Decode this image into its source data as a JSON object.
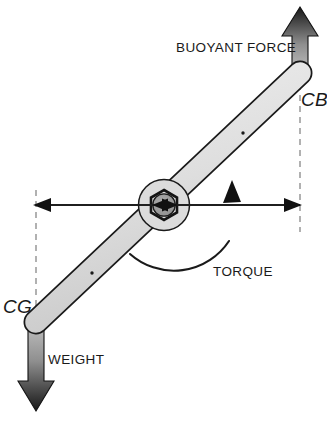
{
  "figure": {
    "type": "physics-free-body-diagram",
    "width": 327,
    "height": 421,
    "background_color": "#ffffff"
  },
  "labels": {
    "buoyant_force": "BUOYANT FORCE",
    "weight": "WEIGHT",
    "torque": "TORQUE",
    "cb": "CB",
    "cg": "CG"
  },
  "colors": {
    "outline": "#1a1a1a",
    "beam_fill_light": "#e6e6e6",
    "beam_fill_mid": "#d2d2d2",
    "hub_fill": "#d9d9d9",
    "nut_fill": "#9a9a9a",
    "arrow_dark": "#1c1c1c",
    "arrow_light": "#b9b9b9",
    "dash_line": "#9e9e9e",
    "text": "#1a1a1a"
  },
  "elements": {
    "beam": {
      "name": "tilted-beam",
      "cg_end": [
        36,
        322
      ],
      "cb_end": [
        300,
        73
      ],
      "half_width": 11,
      "marker_dots": [
        [
          92,
          273
        ],
        [
          243,
          133
        ]
      ]
    },
    "pivot": {
      "name": "pivot-hub",
      "center": [
        164,
        205
      ],
      "outer_radius": 25,
      "nut_radius": 15,
      "inner_radius": 11
    },
    "buoyant_force_arrow": {
      "direction": "up",
      "x": 300,
      "tail_y": 73,
      "head_y": 8,
      "shaft_width": 16,
      "head_width": 36,
      "head_length": 28,
      "gradient": "light-at-tail-dark-at-head"
    },
    "weight_arrow": {
      "direction": "down",
      "x": 36,
      "tail_y": 322,
      "head_y": 410,
      "shaft_width": 16,
      "head_width": 36,
      "head_length": 28,
      "gradient": "light-at-tail-dark-at-head"
    },
    "horizontal_axis": {
      "name": "separation-double-arrow",
      "y": 205,
      "x_left": 33,
      "x_right": 300
    },
    "dashed_verticals": [
      {
        "name": "cg-vertical",
        "x": 36,
        "y_top": 190,
        "y_bottom": 336
      },
      {
        "name": "cb-vertical",
        "x": 300,
        "y_top": 62,
        "y_bottom": 232
      }
    ],
    "torque_arc": {
      "center": [
        164,
        205
      ],
      "radius": 66,
      "start_angle_deg": 170,
      "end_angle_deg": 295,
      "sweep": "counterclockwise-through-bottom",
      "arrowhead_at": "upper-right"
    }
  },
  "text_positions": {
    "buoyant_force": {
      "x": 176,
      "y": 52
    },
    "cb": {
      "x": 301,
      "y": 106
    },
    "cg": {
      "x": 4,
      "y": 313
    },
    "weight": {
      "x": 48,
      "y": 364
    },
    "torque": {
      "x": 213,
      "y": 276
    }
  }
}
